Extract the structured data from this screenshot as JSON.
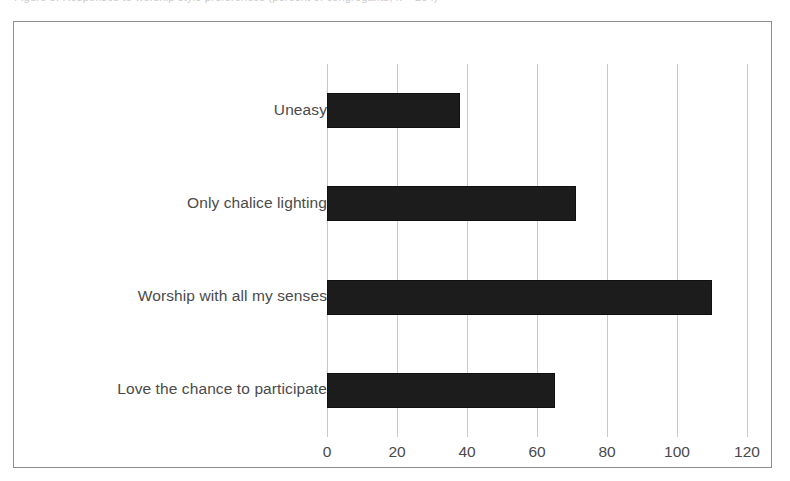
{
  "clipped_caption": "Figure 5.  Responses to worship style preferences (percent of congregants, n = 284)",
  "figure": {
    "background": "#ffffff",
    "frame_color": "#8d8d8d",
    "bar_color": "#1c1c1c",
    "grid_color": "#c9c9c9",
    "text_color": "#4a4a4a"
  },
  "chart_data": {
    "type": "bar",
    "orientation": "horizontal",
    "title": "",
    "subtitle": "",
    "xlabel": "",
    "ylabel": "",
    "categories": [
      "Uneasy",
      "Only chalice lighting",
      "Worship with all my senses",
      "Love the chance to participate"
    ],
    "values": [
      38,
      71,
      110,
      65
    ],
    "xlim": [
      0,
      120
    ],
    "xticks": [
      0,
      20,
      40,
      60,
      80,
      100,
      120
    ],
    "xtick_labels": [
      "0",
      "20",
      "40",
      "60",
      "80",
      "100",
      "120"
    ],
    "grid": "vertical",
    "legend": "none",
    "series": [
      {
        "name": "Responses",
        "values": [
          38,
          71,
          110,
          65
        ]
      }
    ],
    "annotations": []
  }
}
